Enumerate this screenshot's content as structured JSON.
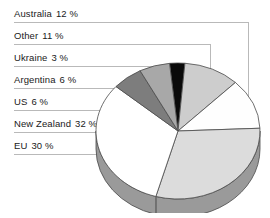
{
  "chart_data": {
    "type": "pie",
    "title": "",
    "xlabel": "",
    "ylabel": "",
    "legend_position": "left-callouts",
    "grid": false,
    "unit": "%",
    "three_d": true,
    "categories": [
      "Australia",
      "Other",
      "Ukraine",
      "Argentina",
      "US",
      "New Zealand",
      "EU"
    ],
    "values": [
      12,
      11,
      3,
      6,
      6,
      32,
      30
    ],
    "labels": [
      {
        "name": "Australia",
        "value": 12,
        "text": "Australia",
        "pct": "12 %",
        "color": "#fefefe"
      },
      {
        "name": "Other",
        "value": 11,
        "text": "Other",
        "pct": "11 %",
        "color": "#cdcdcd"
      },
      {
        "name": "Ukraine",
        "value": 3,
        "text": "Ukraine",
        "pct": "3 %",
        "color": "#0a0a0a"
      },
      {
        "name": "Argentina",
        "value": 6,
        "text": "Argentina",
        "pct": "6 %",
        "color": "#a8a8a8"
      },
      {
        "name": "US",
        "value": 6,
        "text": "US",
        "pct": "6 %",
        "color": "#7d7d7d"
      },
      {
        "name": "New Zealand",
        "value": 32,
        "text": "New Zealand",
        "pct": "32 %",
        "color": "#ffffff"
      },
      {
        "name": "EU",
        "value": 30,
        "text": "EU",
        "pct": "30 %",
        "color": "#dcdcdc"
      }
    ],
    "colors": {
      "australia": "#fefefe",
      "other": "#cdcdcd",
      "ukraine": "#0a0a0a",
      "argentina": "#a8a8a8",
      "us": "#7d7d7d",
      "new_zealand": "#ffffff",
      "eu": "#dcdcdc",
      "side_wall": "#9a9a9a",
      "outline": "#4a4a4a",
      "leader_line": "#b9b9b9",
      "text": "#1a1a1a",
      "background": "#ffffff"
    }
  }
}
